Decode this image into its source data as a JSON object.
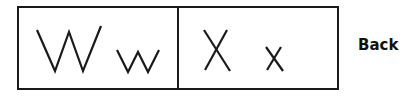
{
  "letters": [
    {
      "upper": "W",
      "lower": "w"
    },
    {
      "upper": "X",
      "lower": "x"
    }
  ],
  "back_label": "Back"
}
